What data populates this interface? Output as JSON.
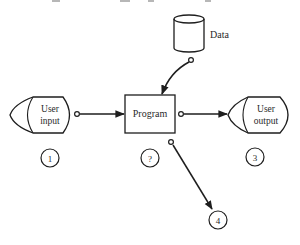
{
  "diagram": {
    "caption_fragment": "",
    "nodes": {
      "data_store": {
        "label": "Data",
        "shape": "cylinder"
      },
      "program": {
        "label": "Program",
        "shape": "rectangle"
      },
      "user_input": {
        "label_line1": "User",
        "label_line2": "input",
        "shape": "display"
      },
      "user_output": {
        "label_line1": "User",
        "label_line2": "output",
        "shape": "display"
      }
    },
    "markers": [
      {
        "id": "1",
        "label": "1"
      },
      {
        "id": "2",
        "label": "?"
      },
      {
        "id": "3",
        "label": "3"
      },
      {
        "id": "4",
        "label": "4"
      }
    ],
    "edges": [
      {
        "from": "data_store",
        "to": "program"
      },
      {
        "from": "user_input",
        "to": "program"
      },
      {
        "from": "program",
        "to": "user_output"
      },
      {
        "from": "program",
        "to": "marker_4"
      }
    ],
    "colors": {
      "line": "#1e1e1e",
      "text": "#2a2a2a",
      "background": "#ffffff"
    }
  }
}
